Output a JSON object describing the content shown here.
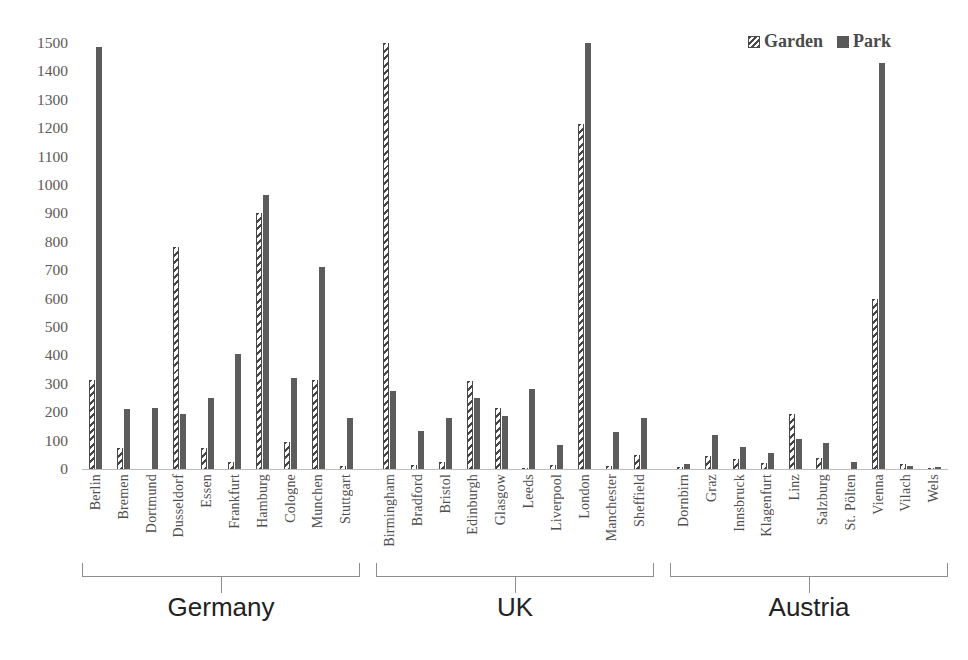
{
  "legend": {
    "position": "top-right",
    "items": [
      {
        "label": "Garden",
        "pattern": "diagonal-hatch",
        "color": "#4a4a4a",
        "icon": "hatch-swatch-icon"
      },
      {
        "label": "Park",
        "pattern": "solid",
        "color": "#595959",
        "icon": "solid-swatch-icon"
      }
    ]
  },
  "axis": {
    "y_ticks": [
      "0",
      "100",
      "200",
      "300",
      "400",
      "500",
      "600",
      "700",
      "800",
      "900",
      "1000",
      "1100",
      "1200",
      "1300",
      "1400",
      "1500"
    ]
  },
  "countries": [
    {
      "name": "Germany"
    },
    {
      "name": "UK"
    },
    {
      "name": "Austria"
    }
  ],
  "chart_data": {
    "type": "bar",
    "title": "",
    "xlabel": "",
    "ylabel": "",
    "ylim": [
      0,
      1500
    ],
    "ytick_step": 100,
    "grid": false,
    "legend_position": "top-right",
    "groups": [
      "Germany",
      "UK",
      "Austria"
    ],
    "group_sizes": [
      10,
      10,
      10
    ],
    "categories": [
      "Berlin",
      "Bremen",
      "Dortmund",
      "Dusseldorf",
      "Essen",
      "Frankfurt",
      "Hamburg",
      "Cologne",
      "Munchen",
      "Stuttgart",
      "Birmingham",
      "Bradford",
      "Bristol",
      "Edinburgh",
      "Glasgow",
      "Leeds",
      "Liverpool",
      "London",
      "Manchester",
      "Sheffield",
      "Dornbirn",
      "Graz",
      "Innsbruck",
      "Klagenfurt",
      "Linz",
      "Salzburg",
      "St. Pölten",
      "Vienna",
      "Vilach",
      "Wels"
    ],
    "series": [
      {
        "name": "Garden",
        "values": [
          315,
          75,
          0,
          780,
          75,
          25,
          900,
          95,
          315,
          10,
          1500,
          15,
          25,
          310,
          215,
          5,
          15,
          1215,
          10,
          50,
          8,
          45,
          35,
          20,
          195,
          38,
          0,
          600,
          18,
          5
        ]
      },
      {
        "name": "Park",
        "values": [
          1485,
          210,
          215,
          195,
          250,
          405,
          965,
          320,
          710,
          180,
          275,
          135,
          180,
          250,
          185,
          280,
          85,
          1500,
          130,
          180,
          18,
          120,
          78,
          55,
          105,
          92,
          25,
          1430,
          10,
          8
        ]
      }
    ]
  }
}
